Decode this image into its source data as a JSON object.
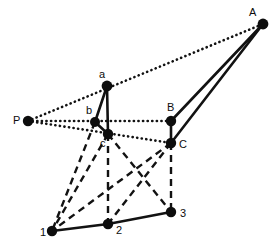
{
  "figure": {
    "background_color": "#ffffff",
    "stroke_color": "#121212",
    "width": 277,
    "height": 252
  },
  "vertices": [
    {
      "id": "P",
      "label": "P",
      "x": 28,
      "y": 121,
      "r": 5.2,
      "label_dx": -15,
      "label_dy": -6
    },
    {
      "id": "A",
      "label": "A",
      "x": 263,
      "y": 24,
      "r": 5.4,
      "label_dx": -14,
      "label_dy": -17
    },
    {
      "id": "a",
      "label": "a",
      "x": 107,
      "y": 86,
      "r": 5.4,
      "label_dx": -8,
      "label_dy": -17
    },
    {
      "id": "b",
      "label": "b",
      "x": 95,
      "y": 122,
      "r": 5.0,
      "label_dx": -9,
      "label_dy": -17
    },
    {
      "id": "c",
      "label": "c",
      "x": 108,
      "y": 134,
      "r": 5.2,
      "label_dx": -8,
      "label_dy": 4
    },
    {
      "id": "B",
      "label": "B",
      "x": 171,
      "y": 121,
      "r": 5.2,
      "label_dx": -4,
      "label_dy": -19
    },
    {
      "id": "C",
      "label": "C",
      "x": 171,
      "y": 143,
      "r": 5.2,
      "label_dx": 8,
      "label_dy": -4
    },
    {
      "id": "v1",
      "label": "1",
      "x": 52,
      "y": 231,
      "r": 5.2,
      "label_dx": -12,
      "label_dy": -4
    },
    {
      "id": "v2",
      "label": "2",
      "x": 108,
      "y": 224,
      "r": 5.2,
      "label_dx": 8,
      "label_dy": 1
    },
    {
      "id": "v3",
      "label": "3",
      "x": 171,
      "y": 212,
      "r": 5.2,
      "label_dx": 9,
      "label_dy": -4
    }
  ],
  "edges": [
    {
      "name": "edge-P-a-A",
      "from": "P",
      "to": "A",
      "style": "dotted"
    },
    {
      "name": "edge-P-b-B",
      "from": "P",
      "to": "B",
      "style": "dotted"
    },
    {
      "name": "edge-P-c-C",
      "from": "P",
      "to": "C",
      "style": "dotted"
    },
    {
      "name": "edge-A-B",
      "from": "A",
      "to": "B",
      "style": "solid"
    },
    {
      "name": "edge-A-C",
      "from": "A",
      "to": "C",
      "style": "solid"
    },
    {
      "name": "edge-B-C",
      "from": "B",
      "to": "C",
      "style": "solid"
    },
    {
      "name": "edge-a-b",
      "from": "a",
      "to": "b",
      "style": "solid"
    },
    {
      "name": "edge-a-c",
      "from": "a",
      "to": "c",
      "style": "solid"
    },
    {
      "name": "edge-b-c",
      "from": "b",
      "to": "c",
      "style": "solid"
    },
    {
      "name": "edge-b-1",
      "from": "b",
      "to": "v1",
      "style": "dashed"
    },
    {
      "name": "edge-c-1",
      "from": "c",
      "to": "v1",
      "style": "dashed"
    },
    {
      "name": "edge-c-2",
      "from": "c",
      "to": "v2",
      "style": "dashed"
    },
    {
      "name": "edge-c-3",
      "from": "c",
      "to": "v3",
      "style": "dashed"
    },
    {
      "name": "edge-C-1",
      "from": "C",
      "to": "v1",
      "style": "dashed"
    },
    {
      "name": "edge-C-2",
      "from": "C",
      "to": "v2",
      "style": "dashed"
    },
    {
      "name": "edge-C-3",
      "from": "C",
      "to": "v3",
      "style": "dashed"
    },
    {
      "name": "edge-1-2",
      "from": "v1",
      "to": "v2",
      "style": "solid"
    },
    {
      "name": "edge-2-3",
      "from": "v2",
      "to": "v3",
      "style": "solid"
    }
  ]
}
